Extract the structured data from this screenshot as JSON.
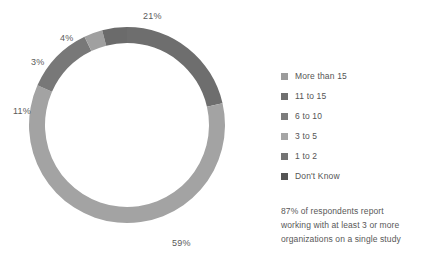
{
  "chart_data": {
    "type": "pie",
    "variant": "donut",
    "title": "",
    "subtitle": "",
    "xlabel": "",
    "ylabel": "",
    "grid": false,
    "legend_position": "right",
    "center": {
      "x": 127,
      "y": 125
    },
    "outer_radius": 98,
    "inner_radius": 82,
    "start_angle_deg": -90,
    "direction": "clockwise",
    "categories": [
      "More than 15",
      "11 to 15",
      "6 to 10",
      "3 to 5",
      "1 to 2",
      "Don't Know"
    ],
    "values": [
      21,
      59,
      11,
      3,
      4,
      0
    ],
    "slices": [
      {
        "label": "More than 15",
        "value": 21,
        "display": "21%",
        "color": "#6e6e6e",
        "label_x": 143,
        "label_y": 11
      },
      {
        "label": "11 to 15",
        "value": 59,
        "display": "59%",
        "color": "#a3a3a3",
        "label_x": 172,
        "label_y": 238
      },
      {
        "label": "6 to 10",
        "value": 11,
        "display": "11%",
        "color": "#787878",
        "label_x": 13,
        "label_y": 106
      },
      {
        "label": "3 to 5",
        "value": 3,
        "display": "3%",
        "color": "#a0a0a0",
        "label_x": 31,
        "label_y": 57
      },
      {
        "label": "1 to 2",
        "value": 4,
        "display": "4%",
        "color": "#6b6b6b",
        "label_x": 60,
        "label_y": 33
      },
      {
        "label": "Don't Know",
        "value": 0,
        "display": "",
        "color": "#5a5a5a",
        "label_x": 0,
        "label_y": 0
      }
    ],
    "annotations": [
      "87% of respondents report",
      "working with at least 3 or more",
      "organizations on a single study"
    ]
  },
  "legend": {
    "items": [
      {
        "label": "More than 15",
        "color": "#9b9b9b"
      },
      {
        "label": "11 to 15",
        "color": "#6f6f6f"
      },
      {
        "label": "6 to 10",
        "color": "#7c7c7c"
      },
      {
        "label": "3 to 5",
        "color": "#a5a5a5"
      },
      {
        "label": "1 to 2",
        "color": "#747474"
      },
      {
        "label": "Don't Know",
        "color": "#545454"
      }
    ]
  },
  "caption": {
    "line1": "87% of respondents report",
    "line2": "working with at least 3 or more",
    "line3": "organizations on a single study"
  }
}
